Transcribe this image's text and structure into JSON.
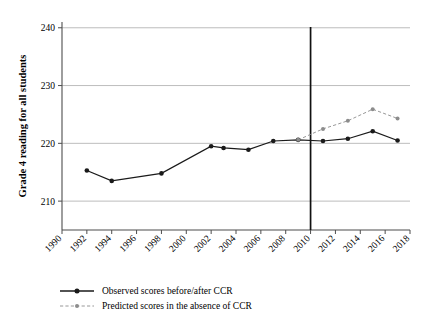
{
  "chart_data": {
    "type": "line",
    "title": "",
    "xlabel": "",
    "ylabel": "Grade 4 reading for all students",
    "xlim": [
      1990,
      2018
    ],
    "ylim": [
      205,
      241
    ],
    "yticks": [
      210,
      220,
      230,
      240
    ],
    "xticks": [
      1990,
      1992,
      1994,
      1996,
      1998,
      2000,
      2002,
      2004,
      2006,
      2008,
      2010,
      2012,
      2014,
      2016,
      2018
    ],
    "grid": "horizontal",
    "legend_position": "bottom-left",
    "annotations": [
      {
        "type": "vline",
        "x": 2010,
        "label": ""
      }
    ],
    "series": [
      {
        "name": "Observed scores before/after CCR",
        "color": "#1a1a1a",
        "style": "solid",
        "marker": "circle",
        "points": [
          {
            "x": 1992,
            "y": 215.3
          },
          {
            "x": 1994,
            "y": 213.5
          },
          {
            "x": 1998,
            "y": 214.8
          },
          {
            "x": 2002,
            "y": 219.5
          },
          {
            "x": 2003,
            "y": 219.2
          },
          {
            "x": 2005,
            "y": 218.9
          },
          {
            "x": 2007,
            "y": 220.4
          },
          {
            "x": 2009,
            "y": 220.6
          },
          {
            "x": 2011,
            "y": 220.4
          },
          {
            "x": 2013,
            "y": 220.8
          },
          {
            "x": 2015,
            "y": 222.1
          },
          {
            "x": 2017,
            "y": 220.5
          }
        ]
      },
      {
        "name": "Predicted scores in the absence of CCR",
        "color": "#8c8c8c",
        "style": "dashed",
        "marker": "circle",
        "points": [
          {
            "x": 2009,
            "y": 220.6
          },
          {
            "x": 2011,
            "y": 222.5
          },
          {
            "x": 2013,
            "y": 223.9
          },
          {
            "x": 2015,
            "y": 225.9
          },
          {
            "x": 2017,
            "y": 224.3
          }
        ]
      }
    ]
  },
  "legend": {
    "items": [
      {
        "label": "Observed scores before/after CCR",
        "color": "#1a1a1a",
        "style": "solid"
      },
      {
        "label": "Predicted scores in the absence of CCR",
        "color": "#8c8c8c",
        "style": "dashed"
      }
    ]
  },
  "colors": {
    "observed": "#1a1a1a",
    "predicted": "#8c8c8c",
    "grid": "#b5b5b5",
    "axis": "#4d4d4d",
    "vline": "#111111",
    "background": "#ffffff"
  }
}
